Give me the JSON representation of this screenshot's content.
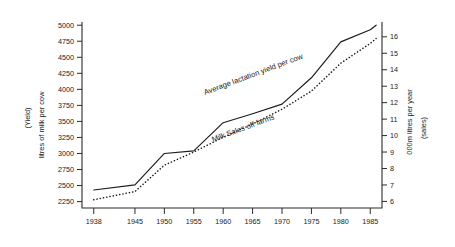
{
  "chart_data": {
    "type": "line",
    "title": "",
    "xlabel": "",
    "grid": false,
    "legend_position": "inline-annotations",
    "x": [
      1938,
      1945,
      1950,
      1955,
      1960,
      1965,
      1970,
      1975,
      1980,
      1985,
      1986
    ],
    "xtick_labels": [
      "1938",
      "1945",
      "1950",
      "1955",
      "1960",
      "1965",
      "1970",
      "1975",
      "1980",
      "1985"
    ],
    "xlim": [
      1936,
      1987
    ],
    "left_axis": {
      "label_primary": "litres of milk per cow",
      "label_secondary": "(Yield)",
      "ylim": [
        2150,
        5050
      ],
      "ticks": [
        2250,
        2500,
        2750,
        3000,
        3250,
        3500,
        3750,
        4000,
        4250,
        4500,
        4750,
        5000
      ],
      "tick_labels": [
        "2250",
        "2500",
        "2750",
        "3000",
        "3250",
        "3500",
        "3750",
        "4000",
        "4250",
        "4500",
        "4750",
        "5000"
      ]
    },
    "right_axis": {
      "label_primary": "000m litres per year",
      "label_secondary": "(sales)",
      "ylim": [
        5.6,
        16.9
      ],
      "ticks": [
        6,
        7,
        8,
        9,
        10,
        11,
        12,
        13,
        14,
        15,
        16
      ],
      "tick_labels": [
        "6",
        "7",
        "8",
        "9",
        "10",
        "11",
        "12",
        "13",
        "14",
        "15",
        "16"
      ]
    },
    "series": [
      {
        "name": "Average lactation yield per cow",
        "axis": "left",
        "style": "solid",
        "color": "#1a1a1a",
        "values": [
          2430,
          2510,
          3000,
          3040,
          3480,
          3620,
          3770,
          4180,
          4740,
          4930,
          5000
        ]
      },
      {
        "name": "Milk Sales off farms",
        "axis": "right",
        "style": "dotted",
        "color": "#1a1a1a",
        "values": [
          6.1,
          6.6,
          8.2,
          9.0,
          9.9,
          10.7,
          11.6,
          12.7,
          14.4,
          15.6,
          15.9
        ]
      }
    ],
    "annotations": [
      {
        "name": "series-label-yield",
        "text": "Average lactation yield per cow"
      },
      {
        "name": "series-label-sales",
        "text": "Milk Sales off farms"
      }
    ]
  }
}
